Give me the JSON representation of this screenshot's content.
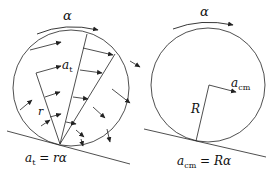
{
  "left_panel": {
    "alpha_label": "α",
    "at_label_base": "a",
    "at_label_sub": "t",
    "r_label": "r",
    "equation_lhs_base": "a",
    "equation_lhs_sub": "t",
    "equation_rhs": " = rα"
  },
  "right_panel": {
    "alpha_label": "α",
    "acm_label_base": "a",
    "acm_label_sub": "cm",
    "R_label": "R",
    "equation_lhs_base": "a",
    "equation_lhs_sub": "cm",
    "equation_rhs": " = Rα"
  },
  "colors": {
    "stroke": "#222222",
    "background": "#ffffff"
  }
}
